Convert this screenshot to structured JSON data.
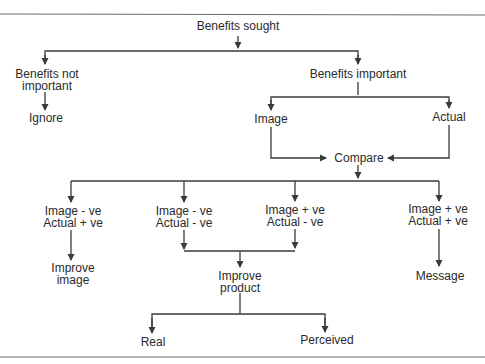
{
  "diagram": {
    "type": "flowchart",
    "colors": {
      "line": "#3a3a3a",
      "text": "#2a2a2a",
      "rule": "#6a6a6a",
      "background": "#ffffff"
    },
    "nodes": {
      "benefits_sought": {
        "lines": [
          "Benefits sought"
        ]
      },
      "benefits_not_important": {
        "lines": [
          "Benefits not",
          "important"
        ]
      },
      "benefits_important": {
        "lines": [
          "Benefits important"
        ]
      },
      "ignore": {
        "lines": [
          "Ignore"
        ]
      },
      "image": {
        "lines": [
          "Image"
        ]
      },
      "actual": {
        "lines": [
          "Actual"
        ]
      },
      "compare": {
        "lines": [
          "Compare"
        ]
      },
      "img_neg_act_pos": {
        "lines": [
          "Image - ve",
          "Actual + ve"
        ]
      },
      "img_neg_act_neg": {
        "lines": [
          "Image - ve",
          "Actual - ve"
        ]
      },
      "img_pos_act_neg": {
        "lines": [
          "Image + ve",
          "Actual - ve"
        ]
      },
      "img_pos_act_pos": {
        "lines": [
          "Image + ve",
          "Actual + ve"
        ]
      },
      "improve_image": {
        "lines": [
          "Improve",
          "image"
        ]
      },
      "improve_product": {
        "lines": [
          "Improve",
          "product"
        ]
      },
      "message": {
        "lines": [
          "Message"
        ]
      },
      "real": {
        "lines": [
          "Real"
        ]
      },
      "perceived": {
        "lines": [
          "Perceived"
        ]
      }
    },
    "edges": [
      [
        "Benefits sought",
        "Benefits not important"
      ],
      [
        "Benefits sought",
        "Benefits important"
      ],
      [
        "Benefits not important",
        "Ignore"
      ],
      [
        "Benefits important",
        "Image"
      ],
      [
        "Benefits important",
        "Actual"
      ],
      [
        "Image",
        "Compare"
      ],
      [
        "Actual",
        "Compare"
      ],
      [
        "Compare",
        "Image - ve / Actual + ve"
      ],
      [
        "Compare",
        "Image - ve / Actual - ve"
      ],
      [
        "Compare",
        "Image + ve / Actual - ve"
      ],
      [
        "Compare",
        "Image + ve / Actual + ve"
      ],
      [
        "Image - ve / Actual + ve",
        "Improve image"
      ],
      [
        "Image - ve / Actual - ve",
        "Improve product"
      ],
      [
        "Image + ve / Actual - ve",
        "Improve product"
      ],
      [
        "Image + ve / Actual + ve",
        "Message"
      ],
      [
        "Improve product",
        "Real"
      ],
      [
        "Improve product",
        "Perceived"
      ]
    ]
  }
}
